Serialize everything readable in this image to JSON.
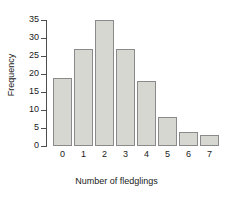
{
  "chart_data": {
    "type": "bar",
    "title": "",
    "subtitle": "",
    "xlabel": "Number of fledglings",
    "ylabel": "Frequency",
    "categories": [
      "0",
      "1",
      "2",
      "3",
      "4",
      "5",
      "6",
      "7"
    ],
    "values": [
      19,
      27,
      35,
      27,
      18,
      8,
      4,
      3
    ],
    "yticks": [
      "0",
      "5",
      "10",
      "15",
      "20",
      "25",
      "30",
      "35"
    ],
    "ytick_values": [
      0,
      5,
      10,
      15,
      20,
      25,
      30,
      35
    ],
    "ylim": [
      0,
      35
    ],
    "xlim": [
      0,
      8
    ],
    "grid": false,
    "legend": null,
    "annotations": [],
    "colors": {
      "bar_fill": "#d7d7d2",
      "bar_border": "#8a8a8a",
      "axis": "#4d4d4d",
      "text": "#1a1a1a",
      "background": "#ffffff"
    }
  }
}
